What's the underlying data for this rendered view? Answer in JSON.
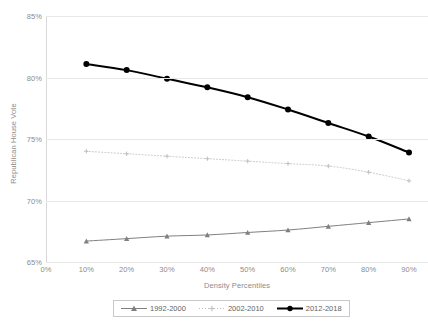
{
  "chart_data": {
    "type": "line",
    "title": "",
    "xlabel": "Density Percentiles",
    "ylabel": "Republican House Vote",
    "x": [
      10,
      20,
      30,
      40,
      50,
      60,
      70,
      80,
      90
    ],
    "xtick_labels": [
      "0%",
      "10%",
      "20%",
      "30%",
      "40%",
      "50%",
      "60%",
      "70%",
      "80%",
      "90%"
    ],
    "xticks": [
      0,
      10,
      20,
      30,
      40,
      50,
      60,
      70,
      80,
      90
    ],
    "xlim": [
      0,
      90
    ],
    "ytick_labels": [
      "65%",
      "70%",
      "75%",
      "80%",
      "85%"
    ],
    "yticks": [
      65,
      70,
      75,
      80,
      85
    ],
    "ylim": [
      65,
      85
    ],
    "grid": true,
    "legend_position": "bottom",
    "series": [
      {
        "name": "1992-2000",
        "marker": "triangle",
        "linestyle": "solid",
        "color": "#808080",
        "values": [
          66.7,
          66.9,
          67.1,
          67.2,
          67.4,
          67.6,
          67.9,
          68.2,
          68.5
        ]
      },
      {
        "name": "2002-2010",
        "marker": "plus",
        "linestyle": "dotted",
        "color": "#bfbfbf",
        "values": [
          74.0,
          73.8,
          73.6,
          73.4,
          73.2,
          73.0,
          72.8,
          72.3,
          71.6
        ]
      },
      {
        "name": "2012-2018",
        "marker": "circle",
        "linestyle": "solid-bold",
        "color": "#000000",
        "values": [
          81.1,
          80.6,
          79.9,
          79.2,
          78.4,
          77.4,
          76.3,
          75.2,
          73.9
        ]
      }
    ]
  },
  "axes": {
    "y_title": "Republican House Vote",
    "x_title": "Density Percentiles",
    "y_ticks": [
      "85%",
      "80%",
      "75%",
      "70%",
      "65%"
    ],
    "x_ticks": [
      "0%",
      "10%",
      "20%",
      "30%",
      "40%",
      "50%",
      "60%",
      "70%",
      "80%",
      "90%"
    ]
  },
  "legend": {
    "items": [
      {
        "label": "1992-2000"
      },
      {
        "label": "2002-2010"
      },
      {
        "label": "2012-2018"
      }
    ]
  },
  "colors": {
    "grid": "#e8e8e8",
    "axis": "#d9d9d9",
    "text": "#8c8c8c",
    "series_1992_2000": "#808080",
    "series_2002_2010": "#bfbfbf",
    "series_2012_2018": "#000000"
  }
}
